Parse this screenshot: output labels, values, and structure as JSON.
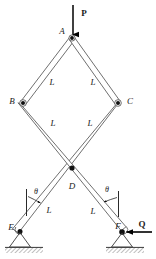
{
  "diagram": {
    "colors": {
      "member_stroke": "#555555",
      "member_fill": "#ffffff",
      "joint": "#111111",
      "force": "#000000",
      "ground_hatch": "#8a8a8a",
      "background": "#ffffff"
    },
    "loads": [
      {
        "name": "P",
        "label": "P",
        "type": "force-arrow",
        "direction": "down",
        "applied_at": "A",
        "x": 84,
        "y": 13
      },
      {
        "name": "Q",
        "label": "Q",
        "type": "force-arrow",
        "direction": "left",
        "applied_at": "F",
        "x": 142,
        "y": 224
      }
    ],
    "joints": [
      {
        "name": "A",
        "label": "A",
        "x": 72,
        "y": 38,
        "label_x": 62,
        "label_y": 31
      },
      {
        "name": "B",
        "label": "B",
        "x": 23,
        "y": 103,
        "label_x": 12,
        "label_y": 101
      },
      {
        "name": "C",
        "label": "C",
        "x": 118,
        "y": 103,
        "label_x": 130,
        "label_y": 101
      },
      {
        "name": "D",
        "label": "D",
        "x": 72,
        "y": 168,
        "label_x": 72,
        "label_y": 186
      },
      {
        "name": "E",
        "label": "E",
        "x": 20,
        "y": 231,
        "label_x": 11,
        "label_y": 227
      },
      {
        "name": "F",
        "label": "F",
        "x": 122,
        "y": 232,
        "label_x": 118,
        "label_y": 226
      }
    ],
    "members": [
      {
        "name": "member-A-B",
        "from": "A",
        "to": "B",
        "length_label": "L",
        "label_x": 52,
        "label_y": 82
      },
      {
        "name": "member-A-C",
        "from": "A",
        "to": "C",
        "length_label": "L",
        "label_x": 93,
        "label_y": 82
      },
      {
        "name": "member-B-D",
        "from": "B",
        "to": "D",
        "length_label": "L",
        "label_x": 53,
        "label_y": 123
      },
      {
        "name": "member-C-D",
        "from": "C",
        "to": "D",
        "length_label": "L",
        "label_x": 90,
        "label_y": 123
      },
      {
        "name": "member-D-E",
        "from": "D",
        "to": "E",
        "length_label": "L",
        "label_x": 49,
        "label_y": 210
      },
      {
        "name": "member-D-F",
        "from": "D",
        "to": "F",
        "length_label": "L",
        "label_x": 93,
        "label_y": 211
      }
    ],
    "angles": [
      {
        "name": "angle-theta-left",
        "label": "θ",
        "label_x": 36,
        "label_y": 192,
        "vertex": "E",
        "reference": "vertical"
      },
      {
        "name": "angle-theta-right",
        "label": "θ",
        "label_x": 107,
        "label_y": 190,
        "vertex": "F",
        "reference": "vertical"
      }
    ],
    "supports": [
      {
        "name": "pin-support-left",
        "at": "E",
        "type": "pin-with-hatched-ground"
      },
      {
        "name": "pin-support-right",
        "at": "F",
        "type": "pin-with-hatched-ground"
      }
    ]
  }
}
